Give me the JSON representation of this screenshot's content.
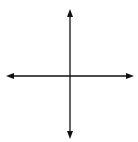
{
  "diagram": {
    "type": "coordinate-plane",
    "grid": {
      "columns": 8,
      "rows": 8,
      "units_per_square": 2,
      "x_range": [
        -8,
        8
      ],
      "y_range": [
        -8,
        8
      ]
    },
    "axes": {
      "x_label": "x",
      "y_label": "y",
      "x_tick_label": "4",
      "y_tick_label_pos": "4",
      "y_tick_label_neg": "−4"
    },
    "triangle": {
      "vertices": [
        {
          "name": "S",
          "x": -1,
          "y": 5
        },
        {
          "name": "T",
          "x": -5,
          "y": 1
        },
        {
          "name": "R",
          "x": -4,
          "y": 0
        }
      ]
    },
    "colors": {
      "grid": "#9a9a9a",
      "axis": "#111111",
      "shape": "#111111",
      "background": "#ffffff"
    }
  }
}
